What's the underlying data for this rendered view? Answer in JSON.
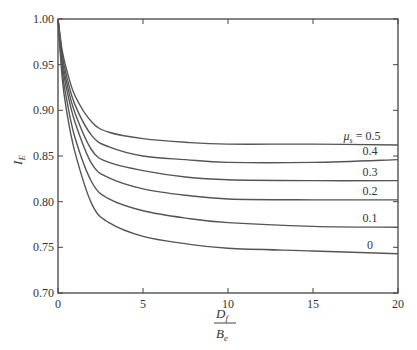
{
  "chart_data": {
    "type": "line",
    "title": "",
    "xlabel": "D_f / B_e",
    "ylabel": "I_E",
    "xlim": [
      0,
      20
    ],
    "ylim": [
      0.7,
      1.0
    ],
    "xticks": [
      0,
      5,
      10,
      15,
      20
    ],
    "xtick_labels": [
      "0",
      "5",
      "10",
      "15",
      "20"
    ],
    "yticks": [
      0.7,
      0.75,
      0.8,
      0.85,
      0.9,
      0.95,
      1.0
    ],
    "ytick_labels": [
      "0.70",
      "0.75",
      "0.80",
      "0.85",
      "0.90",
      "0.95",
      "1.00"
    ],
    "grid": false,
    "legend_position": "inline labels at right end of curves",
    "x": [
      0,
      0.25,
      0.5,
      1,
      2,
      3,
      5,
      7.5,
      10,
      15,
      20
    ],
    "series": [
      {
        "name": "μs = 0.5",
        "label": "μs = 0.5",
        "values": [
          1.0,
          0.965,
          0.945,
          0.916,
          0.887,
          0.876,
          0.869,
          0.865,
          0.863,
          0.863,
          0.862
        ]
      },
      {
        "name": "0.4",
        "label": "0.4",
        "values": [
          1.0,
          0.96,
          0.938,
          0.906,
          0.872,
          0.86,
          0.85,
          0.846,
          0.843,
          0.843,
          0.846
        ]
      },
      {
        "name": "0.3",
        "label": "0.3",
        "values": [
          1.0,
          0.955,
          0.931,
          0.897,
          0.856,
          0.843,
          0.834,
          0.827,
          0.824,
          0.823,
          0.823
        ]
      },
      {
        "name": "0.2",
        "label": "0.2",
        "values": [
          1.0,
          0.95,
          0.924,
          0.887,
          0.841,
          0.826,
          0.814,
          0.807,
          0.803,
          0.802,
          0.802
        ]
      },
      {
        "name": "0.1",
        "label": "0.1",
        "values": [
          1.0,
          0.943,
          0.913,
          0.87,
          0.821,
          0.803,
          0.79,
          0.782,
          0.777,
          0.773,
          0.772
        ]
      },
      {
        "name": "0",
        "label": "0",
        "values": [
          1.0,
          0.935,
          0.9,
          0.854,
          0.797,
          0.777,
          0.762,
          0.754,
          0.749,
          0.746,
          0.743
        ]
      }
    ]
  },
  "labels": {
    "ylabel_main": "I",
    "ylabel_sub": "E",
    "xlabel_num_main": "D",
    "xlabel_num_sub": "f",
    "xlabel_den_main": "B",
    "xlabel_den_sub": "e",
    "mu_prefix": "μ",
    "mu_sub": "s",
    "mu_suffix": " = 0.5"
  },
  "colors": {
    "curve": "#555555",
    "axis": "#444444"
  }
}
